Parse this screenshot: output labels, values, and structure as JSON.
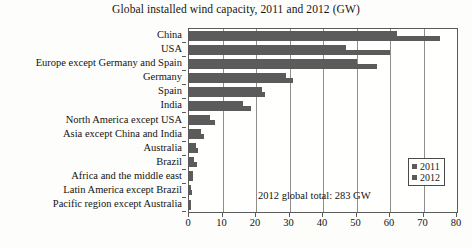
{
  "chart_data": {
    "type": "bar",
    "orientation": "horizontal",
    "title": "Global installed wind capacity, 2011 and 2012 (GW)",
    "xlabel": "",
    "ylabel": "",
    "xlim": [
      0,
      80
    ],
    "xticks": [
      0,
      10,
      20,
      30,
      40,
      50,
      60,
      70,
      80
    ],
    "grid": true,
    "grid_axis": "x",
    "legend_position": "center-right",
    "categories": [
      "China",
      "USA",
      "Europe except Germany and Spain",
      "Germany",
      "Spain",
      "India",
      "North America except USA",
      "Asia except China and India",
      "Australia",
      "Brazil",
      "Africa and the middle east",
      "Latin America except Brazil",
      "Pacific region except Australia"
    ],
    "series": [
      {
        "name": "2011",
        "color": "#5b5b5b",
        "values": [
          62,
          47,
          50,
          29,
          21.7,
          16,
          6.3,
          3.5,
          2.2,
          1.5,
          1.1,
          0.7,
          0.3
        ]
      },
      {
        "name": "2012",
        "color": "#5b5b5b",
        "values": [
          75,
          60,
          56,
          31,
          22.8,
          18.4,
          7.8,
          4.5,
          2.6,
          2.5,
          1.2,
          0.9,
          0.3
        ]
      }
    ],
    "annotations": [
      {
        "text": "2012 global total: 283 GW"
      }
    ]
  },
  "legend": {
    "entries": [
      {
        "label": "2011"
      },
      {
        "label": "2012"
      }
    ]
  },
  "caption": {
    "text": ""
  }
}
